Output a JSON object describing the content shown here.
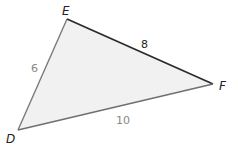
{
  "diagram": {
    "type": "triangle",
    "fill": "#f1f1f1",
    "vertices": [
      {
        "name": "E",
        "x": 67,
        "y": 19,
        "label_x": 62,
        "label_y": 15
      },
      {
        "name": "F",
        "x": 213,
        "y": 84,
        "label_x": 219,
        "label_y": 90
      },
      {
        "name": "D",
        "x": 18,
        "y": 130,
        "label_x": 6,
        "label_y": 143
      }
    ],
    "sides": [
      {
        "between": "DE",
        "length": "6",
        "color": "#7a7a7a",
        "label_x": 31,
        "label_y": 72
      },
      {
        "between": "EF",
        "length": "8",
        "color": "#2b2b2b",
        "label_x": 141,
        "label_y": 48
      },
      {
        "between": "DF",
        "length": "10",
        "color": "#6f6f6f",
        "label_x": 116,
        "label_y": 124
      }
    ]
  }
}
